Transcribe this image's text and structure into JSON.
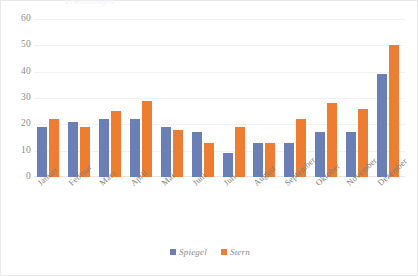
{
  "figure": {
    "title_faint": "Erwähnungen",
    "legend_position": "bottom-center"
  },
  "chart_data": {
    "type": "bar",
    "title": "Erwähnungen",
    "xlabel": "",
    "ylabel": "",
    "ylim": [
      0,
      60
    ],
    "yticks": [
      0,
      10,
      20,
      30,
      40,
      50,
      60
    ],
    "grid": true,
    "categories": [
      "Januar",
      "Februar",
      "März",
      "April",
      "Mai",
      "Juni",
      "Juli",
      "August",
      "September",
      "Oktober",
      "November",
      "Dezember"
    ],
    "series": [
      {
        "name": "Spiegel",
        "color": "#6a7fb5",
        "values": [
          19,
          21,
          22,
          22,
          19,
          17,
          9,
          13,
          13,
          17,
          17,
          39
        ]
      },
      {
        "name": "Stern",
        "color": "#ed7d31",
        "values": [
          22,
          19,
          25,
          29,
          18,
          13,
          19,
          13,
          22,
          28,
          26,
          50
        ]
      }
    ]
  }
}
